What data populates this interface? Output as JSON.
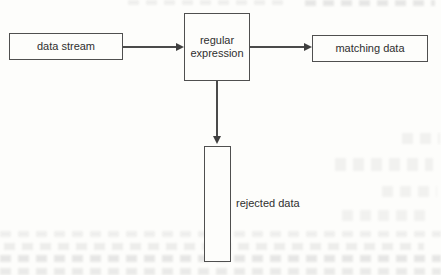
{
  "diagram": {
    "type": "flowchart",
    "nodes": {
      "data_stream": {
        "label": "data stream",
        "shape": "rectangle"
      },
      "regular_expression": {
        "label": "regular expression",
        "shape": "rectangle"
      },
      "matching_data": {
        "label": "matching data",
        "shape": "rectangle"
      },
      "rejected_data": {
        "label": "rejected data",
        "shape": "tall-rectangle",
        "label_position": "right-of-box"
      }
    },
    "edges": [
      {
        "from": "data_stream",
        "to": "regular_expression",
        "direction": "right",
        "style": "solid-arrow"
      },
      {
        "from": "regular_expression",
        "to": "matching_data",
        "direction": "right",
        "style": "solid-arrow"
      },
      {
        "from": "regular_expression",
        "to": "rejected_data",
        "direction": "down",
        "style": "solid-arrow"
      }
    ],
    "colors": {
      "background": "#fdfdfb",
      "box_border": "#4f4f4f",
      "arrow_line": "#4a4a4a",
      "text": "#2f2f2f",
      "bleedthrough_artifact": "#6e6e6e"
    }
  }
}
